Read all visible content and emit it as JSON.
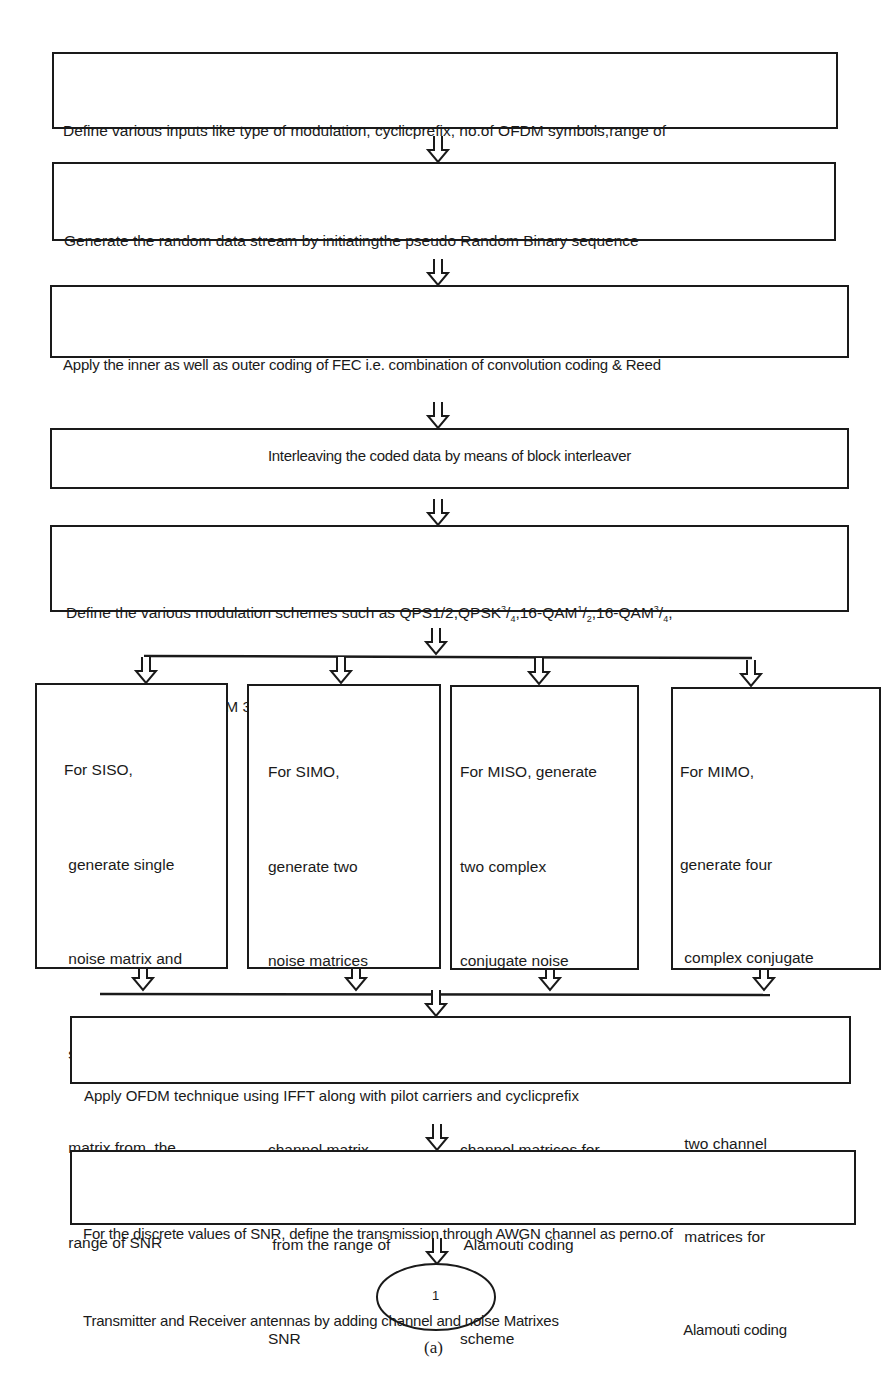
{
  "figure": {
    "caption": "(a)",
    "connector_node_label": "1"
  },
  "steps": [
    {
      "id": "inputs",
      "lines": [
        "Define various inputs like type of modulation, cyclicprefix, no.of OFDM symbols,range of",
        "SNRs,no of Transmitteras well as Receiver Antennas"
      ]
    },
    {
      "id": "random-data",
      "lines": [
        "Generate the random data stream by initiatingthe pseudo Random Binary sequence",
        "Generator"
      ]
    },
    {
      "id": "fec-coding",
      "lines": [
        "Apply the inner as well as outer coding of FEC i.e. combination of convolution coding & Reed",
        "Solomon coding on the randomized data using Galois Polynomial Principle"
      ]
    },
    {
      "id": "interleaving",
      "lines": [
        "Interleaving the coded data by means of block interleaver"
      ]
    },
    {
      "id": "modulation",
      "line1_prefix": "Define the various modulation schemes such as QPS1/2,QPSK",
      "line1_parts": [
        "3",
        "/",
        "4",
        ",16-QAM",
        "1",
        "/",
        "2",
        ",16-QAM",
        "3",
        "/",
        "4",
        ","
      ],
      "line2": "64QAM 2/3 AND64-QAM 3/4"
    },
    {
      "id": "ofdm",
      "lines": [
        "Apply OFDM technique using IFFT along with pilot carriers and cyclicprefix"
      ]
    },
    {
      "id": "awgn",
      "lines": [
        "For the discrete values of SNR, define the transmission through AWGN channel as perno.of",
        "Transmitter and Receiver antennas by adding channel and noise Matrixes"
      ]
    }
  ],
  "branches": [
    {
      "id": "siso",
      "lines": [
        "For SISO,",
        " generate single",
        " noise matrix and",
        " single channel",
        " matrix from  the",
        " range of SNR"
      ]
    },
    {
      "id": "simo",
      "lines": [
        "For SIMO,",
        "generate two",
        "noise matrices",
        "and siingle",
        "channel matrix",
        " from the range of",
        "SNR"
      ]
    },
    {
      "id": "miso",
      "lines": [
        "For MISO, generate",
        "two complex",
        "conjugate noise",
        "matrices and two",
        "channel matrices for",
        " Alamouti coding",
        "scheme"
      ]
    },
    {
      "id": "mimo",
      "lines": [
        "For MIMO,",
        "generate four",
        " complex conjugate",
        "  noise matrices and",
        " two channel",
        " matrices for",
        " Alamouti coding",
        " scheme"
      ]
    }
  ],
  "colors": {
    "stroke": "#1a1a1a",
    "background": "#ffffff",
    "text": "#1a1a1a"
  }
}
